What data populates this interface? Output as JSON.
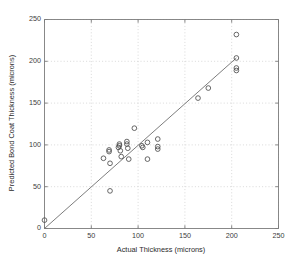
{
  "chart_data": {
    "type": "scatter",
    "title": "",
    "xlabel": "Actual Thickness (microns)",
    "ylabel": "Predicted Bond Coat Thickness (microns)",
    "xlim": [
      0,
      250
    ],
    "ylim": [
      0,
      250
    ],
    "xticks": [
      0,
      50,
      100,
      150,
      200,
      250
    ],
    "yticks": [
      0,
      50,
      100,
      150,
      200,
      250
    ],
    "xtick_labels": [
      "0",
      "50",
      "100",
      "150",
      "200",
      "250"
    ],
    "ytick_labels": [
      "0",
      "50",
      "100",
      "150",
      "200",
      "250"
    ],
    "grid": true,
    "grid_style": "dotted",
    "legend": null,
    "marker": "open-circle",
    "marker_color": "#4d4d4d",
    "reference_line": {
      "name": "y = x identity line",
      "x": [
        0,
        205
      ],
      "y": [
        0,
        204
      ],
      "color": "#6e6e6e"
    },
    "points": [
      {
        "x": 0,
        "y": 10
      },
      {
        "x": 63,
        "y": 84
      },
      {
        "x": 69,
        "y": 92
      },
      {
        "x": 69,
        "y": 94
      },
      {
        "x": 70,
        "y": 78
      },
      {
        "x": 70,
        "y": 45
      },
      {
        "x": 79,
        "y": 97
      },
      {
        "x": 80,
        "y": 101
      },
      {
        "x": 80,
        "y": 99
      },
      {
        "x": 81,
        "y": 93
      },
      {
        "x": 82,
        "y": 86
      },
      {
        "x": 88,
        "y": 104
      },
      {
        "x": 88,
        "y": 101
      },
      {
        "x": 89,
        "y": 96
      },
      {
        "x": 90,
        "y": 83
      },
      {
        "x": 96,
        "y": 120
      },
      {
        "x": 104,
        "y": 99
      },
      {
        "x": 105,
        "y": 97
      },
      {
        "x": 110,
        "y": 103
      },
      {
        "x": 110,
        "y": 83
      },
      {
        "x": 121,
        "y": 107
      },
      {
        "x": 121,
        "y": 98
      },
      {
        "x": 121,
        "y": 95
      },
      {
        "x": 164,
        "y": 156
      },
      {
        "x": 175,
        "y": 168
      },
      {
        "x": 205,
        "y": 232
      },
      {
        "x": 205,
        "y": 204
      },
      {
        "x": 205,
        "y": 192
      },
      {
        "x": 205,
        "y": 189
      }
    ]
  },
  "axes": {
    "x_title": "Actual Thickness (microns)",
    "y_title": "Predicted Bond Coat Thickness (microns)"
  }
}
